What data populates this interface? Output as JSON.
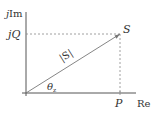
{
  "diagram": {
    "type": "power-triangle",
    "axes": {
      "vertical_label_prefix": "j",
      "vertical_label_main": "Im",
      "horizontal_label": "Re"
    },
    "labels": {
      "imag_component_prefix": "j",
      "imag_component": "Q",
      "real_component": "P",
      "point": "S",
      "magnitude": "|S|",
      "angle_symbol": "θ",
      "angle_subscript": "z"
    },
    "colors": {
      "axis": "#555555",
      "vector": "#777777",
      "dashed": "#888888",
      "text": "#333333"
    }
  }
}
